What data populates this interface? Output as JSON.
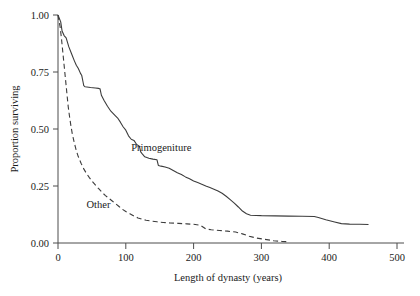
{
  "chart_data": {
    "type": "line",
    "title": "",
    "xlabel": "Length of dynasty (years)",
    "ylabel": "Proportion surviving",
    "xlim": [
      0,
      500
    ],
    "ylim": [
      0.0,
      1.0
    ],
    "xticks": [
      0,
      100,
      200,
      300,
      400,
      500
    ],
    "xtick_labels": [
      "0",
      "100",
      "200",
      "300",
      "400",
      "500"
    ],
    "yticks": [
      0.0,
      0.25,
      0.5,
      0.75,
      1.0
    ],
    "ytick_labels": [
      "0.00",
      "0.25",
      "0.50",
      "0.75",
      "1.00"
    ],
    "grid": false,
    "legend": "inline-annotations",
    "annotations": [
      {
        "text": "Primogeniture",
        "x": 108,
        "y": 0.405
      },
      {
        "text": "Other",
        "x": 42,
        "y": 0.155
      }
    ],
    "series": [
      {
        "name": "Primogeniture",
        "style": "solid",
        "color": "#3c3c3c",
        "points": [
          [
            0,
            1.0
          ],
          [
            4,
            0.97
          ],
          [
            6,
            0.93
          ],
          [
            9,
            0.91
          ],
          [
            12,
            0.9
          ],
          [
            16,
            0.86
          ],
          [
            20,
            0.83
          ],
          [
            24,
            0.8
          ],
          [
            27,
            0.78
          ],
          [
            30,
            0.765
          ],
          [
            33,
            0.745
          ],
          [
            35,
            0.735
          ],
          [
            37,
            0.705
          ],
          [
            38,
            0.69
          ],
          [
            40,
            0.685
          ],
          [
            48,
            0.682
          ],
          [
            55,
            0.68
          ],
          [
            60,
            0.678
          ],
          [
            62,
            0.676
          ],
          [
            64,
            0.648
          ],
          [
            68,
            0.625
          ],
          [
            73,
            0.6
          ],
          [
            78,
            0.578
          ],
          [
            84,
            0.56
          ],
          [
            88,
            0.548
          ],
          [
            92,
            0.53
          ],
          [
            96,
            0.51
          ],
          [
            100,
            0.495
          ],
          [
            104,
            0.47
          ],
          [
            108,
            0.455
          ],
          [
            112,
            0.45
          ],
          [
            116,
            0.432
          ],
          [
            120,
            0.425
          ],
          [
            122,
            0.4
          ],
          [
            124,
            0.392
          ],
          [
            128,
            0.378
          ],
          [
            134,
            0.372
          ],
          [
            140,
            0.368
          ],
          [
            146,
            0.365
          ],
          [
            148,
            0.34
          ],
          [
            152,
            0.337
          ],
          [
            158,
            0.333
          ],
          [
            164,
            0.328
          ],
          [
            170,
            0.318
          ],
          [
            176,
            0.308
          ],
          [
            182,
            0.3
          ],
          [
            188,
            0.29
          ],
          [
            194,
            0.282
          ],
          [
            200,
            0.272
          ],
          [
            206,
            0.265
          ],
          [
            212,
            0.258
          ],
          [
            218,
            0.25
          ],
          [
            224,
            0.243
          ],
          [
            230,
            0.236
          ],
          [
            236,
            0.228
          ],
          [
            242,
            0.218
          ],
          [
            248,
            0.205
          ],
          [
            254,
            0.19
          ],
          [
            260,
            0.175
          ],
          [
            266,
            0.158
          ],
          [
            272,
            0.14
          ],
          [
            278,
            0.128
          ],
          [
            284,
            0.122
          ],
          [
            300,
            0.12
          ],
          [
            320,
            0.119
          ],
          [
            340,
            0.118
          ],
          [
            360,
            0.117
          ],
          [
            378,
            0.116
          ],
          [
            384,
            0.112
          ],
          [
            395,
            0.102
          ],
          [
            408,
            0.092
          ],
          [
            418,
            0.085
          ],
          [
            430,
            0.083
          ],
          [
            445,
            0.082
          ],
          [
            458,
            0.081
          ]
        ]
      },
      {
        "name": "Other",
        "style": "dashed",
        "color": "#3c3c3c",
        "points": [
          [
            0,
            1.0
          ],
          [
            3,
            0.95
          ],
          [
            5,
            0.9
          ],
          [
            7,
            0.84
          ],
          [
            9,
            0.78
          ],
          [
            11,
            0.72
          ],
          [
            13,
            0.66
          ],
          [
            15,
            0.6
          ],
          [
            17,
            0.555
          ],
          [
            19,
            0.515
          ],
          [
            21,
            0.48
          ],
          [
            24,
            0.44
          ],
          [
            27,
            0.405
          ],
          [
            30,
            0.378
          ],
          [
            34,
            0.35
          ],
          [
            38,
            0.325
          ],
          [
            42,
            0.305
          ],
          [
            46,
            0.288
          ],
          [
            50,
            0.272
          ],
          [
            55,
            0.255
          ],
          [
            60,
            0.238
          ],
          [
            65,
            0.222
          ],
          [
            70,
            0.208
          ],
          [
            75,
            0.196
          ],
          [
            80,
            0.184
          ],
          [
            85,
            0.172
          ],
          [
            90,
            0.16
          ],
          [
            95,
            0.148
          ],
          [
            100,
            0.138
          ],
          [
            106,
            0.128
          ],
          [
            112,
            0.118
          ],
          [
            118,
            0.11
          ],
          [
            124,
            0.104
          ],
          [
            130,
            0.1
          ],
          [
            138,
            0.096
          ],
          [
            146,
            0.093
          ],
          [
            155,
            0.09
          ],
          [
            165,
            0.088
          ],
          [
            178,
            0.086
          ],
          [
            190,
            0.084
          ],
          [
            200,
            0.082
          ],
          [
            210,
            0.078
          ],
          [
            218,
            0.062
          ],
          [
            226,
            0.058
          ],
          [
            238,
            0.055
          ],
          [
            250,
            0.052
          ],
          [
            262,
            0.048
          ],
          [
            272,
            0.04
          ],
          [
            282,
            0.03
          ],
          [
            292,
            0.022
          ],
          [
            305,
            0.016
          ],
          [
            318,
            0.01
          ],
          [
            330,
            0.007
          ],
          [
            338,
            0.006
          ]
        ]
      }
    ]
  },
  "geometry": {
    "plot_left": 58,
    "plot_right": 397,
    "plot_top": 15,
    "plot_bottom": 243
  }
}
